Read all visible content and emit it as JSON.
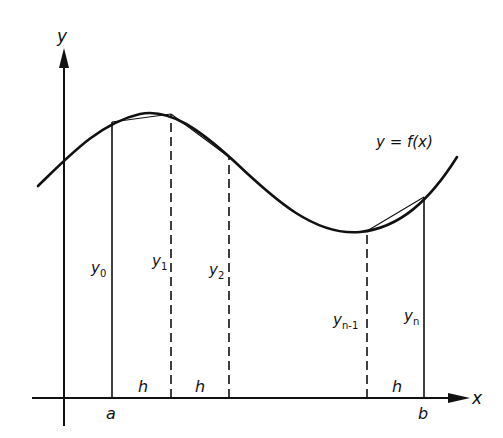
{
  "diagram": {
    "type": "trapezoidal-rule",
    "axes": {
      "x_label": "x",
      "y_label": "y"
    },
    "curve_label": "y = f(x)",
    "interval": {
      "start_label": "a",
      "end_label": "b"
    },
    "ordinates": [
      {
        "base": "y",
        "sub": "0",
        "style": "solid"
      },
      {
        "base": "y",
        "sub": "1",
        "style": "dashed"
      },
      {
        "base": "y",
        "sub": "2",
        "style": "dashed"
      },
      {
        "base": "y",
        "sub": "n-1",
        "style": "dashed"
      },
      {
        "base": "y",
        "sub": "n",
        "style": "solid"
      }
    ],
    "step_labels": [
      "h",
      "h",
      "h"
    ]
  }
}
